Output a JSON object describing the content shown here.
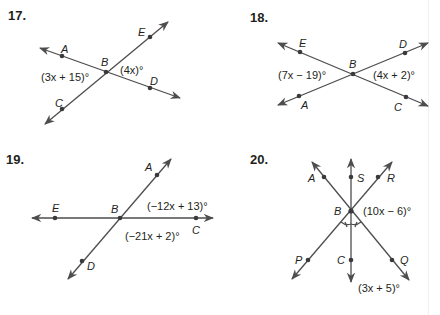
{
  "problems": [
    {
      "number": "17.",
      "points": {
        "A": "A",
        "B": "B",
        "C": "C",
        "D": "D",
        "E": "E"
      },
      "angles": [
        "(3x + 15)°",
        "(4x)°"
      ]
    },
    {
      "number": "18.",
      "points": {
        "A": "A",
        "B": "B",
        "C": "C",
        "D": "D",
        "E": "E"
      },
      "angles": [
        "(7x − 19)°",
        "(4x + 2)°"
      ]
    },
    {
      "number": "19.",
      "points": {
        "A": "A",
        "B": "B",
        "C": "C",
        "D": "D",
        "E": "E"
      },
      "angles": [
        "(−12x + 13)°",
        "(−21x + 2)°"
      ]
    },
    {
      "number": "20.",
      "points": {
        "A": "A",
        "B": "B",
        "C": "C",
        "P": "P",
        "Q": "Q",
        "R": "R",
        "S": "S"
      },
      "angles": [
        "(10x − 6)°",
        "(3x + 5)°"
      ]
    }
  ],
  "colors": {
    "line": "#4d4d4f",
    "text": "#231f20",
    "background": "#ffffff"
  }
}
